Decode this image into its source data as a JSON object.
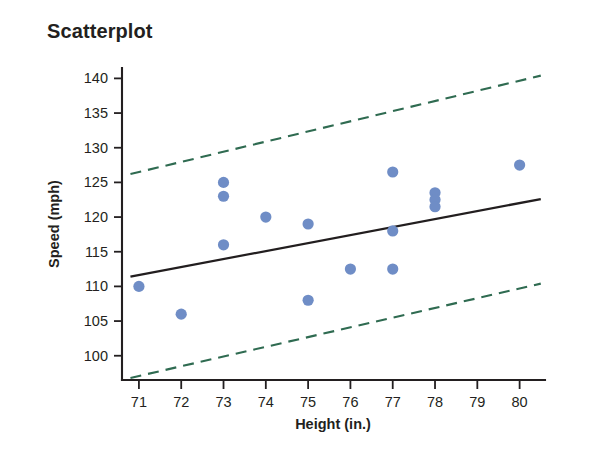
{
  "chart_data": {
    "type": "scatter",
    "title": "Scatterplot",
    "xlabel": "Height (in.)",
    "ylabel": "Speed (mph)",
    "xlim": [
      70.6,
      80.6
    ],
    "ylim": [
      96.5,
      141.5
    ],
    "xticks": [
      71,
      72,
      73,
      74,
      75,
      76,
      77,
      78,
      79,
      80
    ],
    "yticks": [
      100,
      105,
      110,
      115,
      120,
      125,
      130,
      135,
      140
    ],
    "xtick_labels": [
      "71",
      "72",
      "73",
      "74",
      "75",
      "76",
      "77",
      "78",
      "79",
      "80"
    ],
    "ytick_labels": [
      "100",
      "105",
      "110",
      "115",
      "120",
      "125",
      "130",
      "135",
      "140"
    ],
    "grid": false,
    "legend": "none",
    "point_color": "#6f8dc6",
    "fit_line_color": "#221e1f",
    "band_color": "#2f6b51",
    "x": [
      71,
      72,
      73,
      73,
      73,
      74,
      75,
      75,
      76,
      77,
      77,
      77,
      78,
      78,
      78,
      80
    ],
    "y": [
      110,
      106,
      125,
      123,
      116,
      120,
      119,
      108,
      112.5,
      126.5,
      118,
      112.5,
      123.5,
      122.5,
      121.5,
      127.5
    ],
    "points": [
      {
        "x": 71,
        "y": 110
      },
      {
        "x": 72,
        "y": 106
      },
      {
        "x": 73,
        "y": 125
      },
      {
        "x": 73,
        "y": 123
      },
      {
        "x": 73,
        "y": 116
      },
      {
        "x": 74,
        "y": 120
      },
      {
        "x": 75,
        "y": 119
      },
      {
        "x": 75,
        "y": 108
      },
      {
        "x": 76,
        "y": 112.5
      },
      {
        "x": 77,
        "y": 126.5
      },
      {
        "x": 77,
        "y": 118
      },
      {
        "x": 77,
        "y": 112.5
      },
      {
        "x": 78,
        "y": 123.5
      },
      {
        "x": 78,
        "y": 122.5
      },
      {
        "x": 78,
        "y": 121.5
      },
      {
        "x": 80,
        "y": 127.5
      }
    ],
    "series": [
      {
        "name": "regression-line",
        "type": "line",
        "style": "solid",
        "color": "#221e1f",
        "x": [
          70.8,
          80.5
        ],
        "y": [
          111.4,
          122.6
        ]
      },
      {
        "name": "upper-prediction-band",
        "type": "line",
        "style": "dashed",
        "color": "#2f6b51",
        "x": [
          70.8,
          80.5
        ],
        "y": [
          126.2,
          140.4
        ]
      },
      {
        "name": "lower-prediction-band",
        "type": "line",
        "style": "dashed",
        "color": "#2f6b51",
        "x": [
          70.8,
          80.5
        ],
        "y": [
          96.8,
          110.4
        ]
      }
    ]
  }
}
